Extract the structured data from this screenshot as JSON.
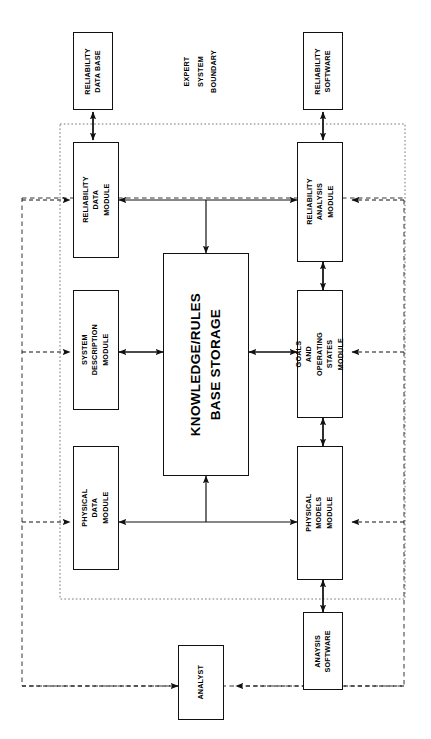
{
  "diagram": {
    "orientation": "text-rotated-90-ccw",
    "annotations": {
      "expert_system_boundary": "EXPERT\nSYSTEM\nBOUNDARY",
      "expert_system_boundary_lines": [
        "EXPERT",
        "SYSTEM",
        "BOUNDARY"
      ]
    },
    "external_boxes": [
      {
        "id": "reliability-data-base",
        "label": "RELIABILITY\nDATA BASE",
        "lines": [
          "RELIABILITY",
          "DATA BASE"
        ]
      },
      {
        "id": "reliability-software",
        "label": "RELIABILITY\nSOFTWARE",
        "lines": [
          "RELIABILITY",
          "SOFTWARE"
        ]
      },
      {
        "id": "anaysis-software",
        "label": "ANAYSIS\nSOFTWARE",
        "lines": [
          "ANAYSIS",
          "SOFTWARE"
        ]
      },
      {
        "id": "analyst",
        "label": "ANALYST",
        "lines": [
          "ANALYST"
        ]
      }
    ],
    "modules": [
      {
        "id": "reliability-data-module",
        "label": "RELIABILITY DATA\nMODULE",
        "lines": [
          "RELIABILITY DATA",
          "MODULE"
        ]
      },
      {
        "id": "system-description-module",
        "label": "SYSTEM DESCRIPTION\nMODULE",
        "lines": [
          "SYSTEM DESCRIPTION",
          "MODULE"
        ]
      },
      {
        "id": "physical-data-module",
        "label": "PHYSICAL DATA\nMODULE",
        "lines": [
          "PHYSICAL DATA",
          "MODULE"
        ]
      },
      {
        "id": "reliability-analysis-module",
        "label": "RELIABILITY ANALYSIS\nMODULE",
        "lines": [
          "RELIABILITY ANALYSIS",
          "MODULE"
        ]
      },
      {
        "id": "goals-and-operating-states-module",
        "label": "GOALS AND OPERATING\nSTATES MODULE",
        "lines": [
          "GOALS AND OPERATING",
          "STATES MODULE"
        ]
      },
      {
        "id": "physical-models-module",
        "label": "PHYSICAL MODELS\nMODULE",
        "lines": [
          "PHYSICAL MODELS",
          "MODULE"
        ]
      }
    ],
    "storage": {
      "id": "knowledge-rules-base-storage",
      "label": "KNOWLEDGE/RULES\nBASE STORAGE",
      "lines": [
        "KNOWLEDGE/RULES",
        "BASE STORAGE"
      ]
    },
    "colors": {
      "line": "#111111",
      "boundary": "#555555",
      "background": "#ffffff"
    }
  }
}
